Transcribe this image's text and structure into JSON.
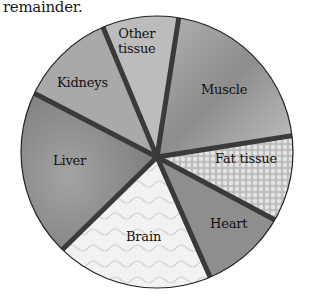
{
  "caption": "remainder.",
  "diagram": {
    "type": "pie-illustration",
    "center": [
      157,
      156
    ],
    "radius": 137,
    "segments": [
      {
        "id": "other-tissue",
        "label_line1": "Other",
        "label_line2": "tissue",
        "fill": "#b9b9b9"
      },
      {
        "id": "muscle",
        "label": "Muscle",
        "fill": "#9f9f9f"
      },
      {
        "id": "fat-tissue",
        "label": "Fat tissue",
        "fill": "#cfcfcf"
      },
      {
        "id": "heart",
        "label": "Heart",
        "fill": "#8f8f8f"
      },
      {
        "id": "brain",
        "label": "Brain",
        "fill": "#ececec"
      },
      {
        "id": "liver",
        "label": "Liver",
        "fill": "#858585"
      },
      {
        "id": "kidneys",
        "label": "Kidneys",
        "fill": "#a8a8a8"
      }
    ],
    "divider_color": "#3a3a3a",
    "rim_color": "#222222"
  }
}
